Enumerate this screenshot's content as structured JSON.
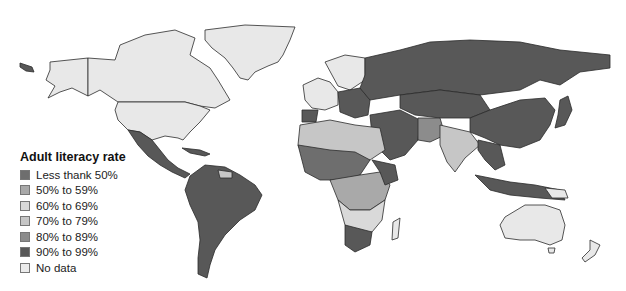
{
  "map": {
    "type": "choropleth-world",
    "title": "Adult literacy rate",
    "colors": {
      "lt50": "#6e6e6e",
      "c50_59": "#a9a9a9",
      "c60_69": "#d9d9d9",
      "c70_79": "#c6c6c6",
      "c80_89": "#8c8c8c",
      "c90_99": "#585858",
      "nodata": "#e8e8e8"
    }
  },
  "legend": {
    "title": "Adult literacy rate",
    "items": [
      {
        "label": "Less thank 50%",
        "color": "#6e6e6e"
      },
      {
        "label": "50% to  59%",
        "color": "#a9a9a9"
      },
      {
        "label": "60% to  69%",
        "color": "#d9d9d9"
      },
      {
        "label": "70% to  79%",
        "color": "#c6c6c6"
      },
      {
        "label": "80% to  89%",
        "color": "#8c8c8c"
      },
      {
        "label": "90% to  99%",
        "color": "#585858"
      },
      {
        "label": "No data",
        "color": "#ebebeb"
      }
    ]
  }
}
